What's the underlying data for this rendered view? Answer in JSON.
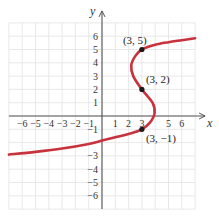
{
  "chart_data": {
    "type": "line",
    "title": "",
    "xlabel": "x",
    "ylabel": "y",
    "xlim": [
      -7,
      7
    ],
    "ylim": [
      -7,
      7
    ],
    "grid": true,
    "x_ticks": [
      -6,
      -5,
      -4,
      -3,
      -2,
      -1,
      1,
      2,
      3,
      5,
      6
    ],
    "x_tick_labels": [
      "−6",
      "−5",
      "−4",
      "−3",
      "−2",
      "−1",
      "1",
      "2",
      "3",
      "5",
      "6"
    ],
    "y_ticks": [
      6,
      5,
      4,
      3,
      2,
      1,
      -1,
      -3,
      -4,
      -5,
      -6
    ],
    "y_tick_labels": [
      "6",
      "5",
      "4",
      "3",
      "2",
      "1",
      "−1",
      "−3",
      "−4",
      "−5",
      "−6"
    ],
    "series": [
      {
        "name": "curve",
        "color": "#c8323c",
        "points": [
          [
            -7,
            -2.9
          ],
          [
            -5,
            -2.7
          ],
          [
            -3,
            -2.45
          ],
          [
            -1,
            -2.1
          ],
          [
            0,
            -1.85
          ],
          [
            1,
            -1.6
          ],
          [
            2,
            -1.35
          ],
          [
            3,
            -1
          ],
          [
            3.6,
            -0.5
          ],
          [
            3.95,
            0.2
          ],
          [
            3.8,
            1.0
          ],
          [
            3,
            2
          ],
          [
            2.35,
            3.0
          ],
          [
            2.2,
            3.8
          ],
          [
            2.5,
            4.5
          ],
          [
            3,
            5
          ],
          [
            4,
            5.35
          ],
          [
            5,
            5.55
          ],
          [
            6,
            5.7
          ],
          [
            7,
            5.85
          ]
        ]
      }
    ],
    "annotations": [
      {
        "label": "(3, 5)",
        "x": 3,
        "y": 5
      },
      {
        "label": "(3, 2)",
        "x": 3,
        "y": 2
      },
      {
        "label": "(3, −1)",
        "x": 3,
        "y": -1
      }
    ]
  },
  "colors": {
    "curve": "#c8323c",
    "grid": "#e2e2e2",
    "axis": "#555555",
    "point": "#1a1a1a"
  }
}
